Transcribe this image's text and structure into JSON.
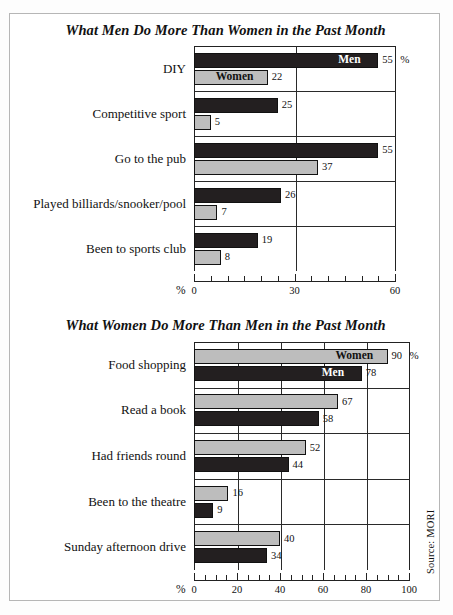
{
  "source_note": "Source: MORI",
  "legend": {
    "men": "Men",
    "women": "Women",
    "percent_symbol": "%"
  },
  "colors": {
    "men_bar": "#231f20",
    "women_bar": "#bdbdbd",
    "axis": "#222222",
    "frame": "#b6b6b6"
  },
  "charts": [
    {
      "title": "What Men Do More Than Women in the Past Month",
      "axis_unit_label": "%",
      "first_group_top_label": "Men",
      "first_group_bottom_label": "Women",
      "chart_data": {
        "type": "bar",
        "orientation": "horizontal",
        "title": "What Men Do More Than Women in the Past Month",
        "xlabel": "%",
        "ylabel": "",
        "xlim": [
          0,
          60
        ],
        "major_ticks": [
          0,
          30,
          60
        ],
        "minor_tick_step": 5,
        "tick_labels": [
          "0",
          "30",
          "60"
        ],
        "grid": true,
        "legend": [
          "Men",
          "Women"
        ],
        "legend_position": "in-bars-first-group",
        "categories": [
          "DIY",
          "Competitive sport",
          "Go to the pub",
          "Played billiards/snooker/pool",
          "Been to sports club"
        ],
        "series": [
          {
            "name": "Men",
            "values": [
              55,
              25,
              55,
              26,
              19
            ]
          },
          {
            "name": "Women",
            "values": [
              22,
              5,
              37,
              7,
              8
            ]
          }
        ]
      }
    },
    {
      "title": "What Women Do More Than Men in the Past Month",
      "axis_unit_label": "%",
      "first_group_top_label": "Women",
      "first_group_bottom_label": "Men",
      "chart_data": {
        "type": "bar",
        "orientation": "horizontal",
        "title": "What Women Do More Than Men in the Past Month",
        "xlabel": "%",
        "ylabel": "",
        "xlim": [
          0,
          100
        ],
        "major_ticks": [
          0,
          20,
          40,
          60,
          80,
          100
        ],
        "minor_tick_step": 5,
        "tick_labels": [
          "0",
          "20",
          "40",
          "60",
          "80",
          "100"
        ],
        "grid": true,
        "legend": [
          "Women",
          "Men"
        ],
        "legend_position": "in-bars-first-group",
        "categories": [
          "Food shopping",
          "Read a book",
          "Had friends round",
          "Been to the theatre",
          "Sunday afternoon drive"
        ],
        "series": [
          {
            "name": "Women",
            "values": [
              90,
              67,
              52,
              16,
              40
            ]
          },
          {
            "name": "Men",
            "values": [
              78,
              58,
              44,
              9,
              34
            ]
          }
        ]
      }
    }
  ]
}
